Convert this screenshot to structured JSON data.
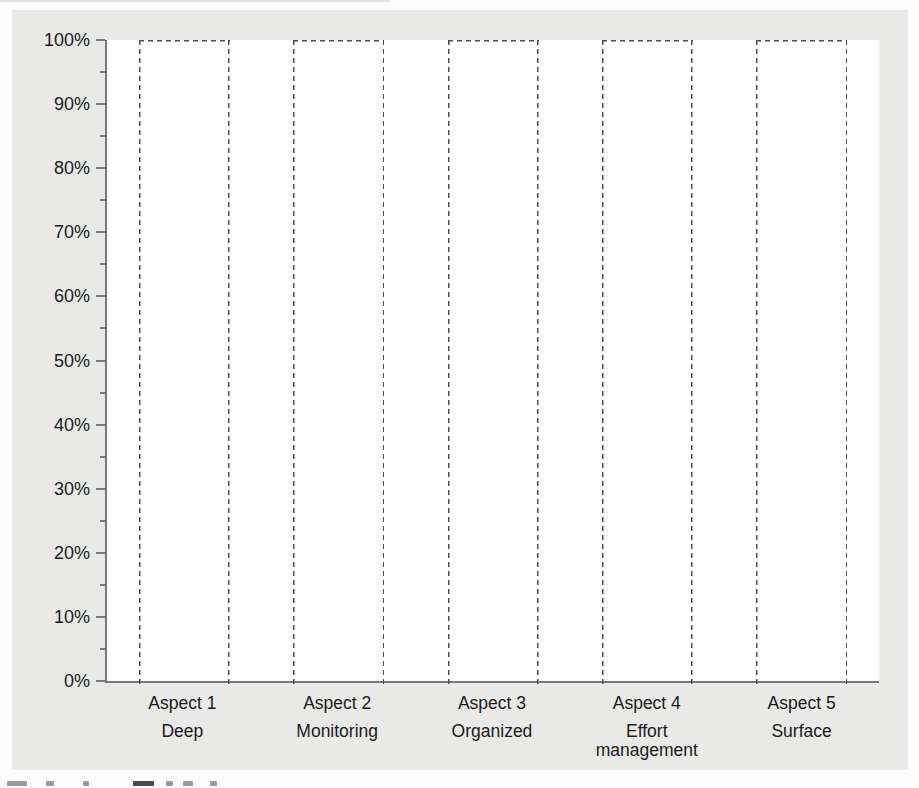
{
  "chart_data": {
    "type": "bar",
    "title": "",
    "xlabel": "",
    "ylabel": "",
    "categories": [
      {
        "label": "Aspect 1",
        "sublabel": "Deep"
      },
      {
        "label": "Aspect 2",
        "sublabel": "Monitoring"
      },
      {
        "label": "Aspect 3",
        "sublabel": "Organized"
      },
      {
        "label": "Aspect 4",
        "sublabel": "Effort\nmanagement"
      },
      {
        "label": "Aspect 5",
        "sublabel": "Surface"
      }
    ],
    "values": [
      100,
      100,
      100,
      100,
      100
    ],
    "yticks": [
      "100%",
      "90%",
      "80%",
      "70%",
      "60%",
      "50%",
      "40%",
      "30%",
      "20%",
      "10%",
      "0%"
    ],
    "ylim": [
      0,
      100
    ],
    "major_tick_step": 10,
    "minor_tick_step": 5,
    "grid": "off",
    "legend": "none",
    "bar_style": "dashed-outline, white fill, full-height"
  },
  "colors": {
    "figure_bg": "#e9e9e7",
    "plot_bg": "#fefefe",
    "axis": "#787878",
    "bar_dash": "#4d4d4d",
    "text": "#1b1b1b"
  }
}
